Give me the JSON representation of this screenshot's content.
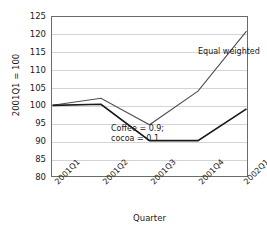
{
  "chart_data": {
    "type": "line",
    "title": "",
    "xlabel": "Quarter",
    "ylabel": "2001Q1 = 100",
    "categories": [
      "2001Q1",
      "2001Q2",
      "2001Q3",
      "2001Q4",
      "2002Q1"
    ],
    "ylim": [
      80,
      125
    ],
    "yticks": [
      80,
      85,
      90,
      95,
      100,
      105,
      110,
      115,
      120,
      125
    ],
    "grid": "horizontal",
    "legend": "none (inline annotations)",
    "series": [
      {
        "name": "Equal weighted",
        "values": [
          100,
          102,
          94.5,
          104,
          121
        ],
        "color": "#4d4d4d",
        "width": 1
      },
      {
        "name": "Coffee = 0.9; cocoa = 0.1",
        "values": [
          100,
          100.3,
          90,
          90,
          99
        ],
        "color": "#1a1a1a",
        "width": 1.6
      }
    ],
    "annotations": [
      {
        "text": "Equal weighted",
        "series": "Equal weighted"
      },
      {
        "text_line1": "Coffee = 0.9;",
        "text_line2": "cocoa = 0.1",
        "series": "Coffee = 0.9; cocoa = 0.1"
      }
    ]
  },
  "axis": {
    "y_tick_labels": [
      "125",
      "120",
      "115",
      "110",
      "105",
      "100",
      "95",
      "90",
      "85",
      "80"
    ],
    "y_axis_title": "2001Q1 = 100",
    "x_tick_labels": [
      "2001Q1",
      "2001Q2",
      "2001Q3",
      "2001Q4",
      "2002Q1"
    ],
    "x_axis_title": "Quarter"
  },
  "annotations": {
    "equal_weighted": "Equal weighted",
    "mix_line1": "Coffee = 0.9;",
    "mix_line2": "cocoa = 0.1"
  },
  "colors": {
    "background": "#ffffff",
    "frame": "#6b6b6b",
    "grid": "#d4d4d4",
    "series_equal_weighted": "#4d4d4d",
    "series_mix": "#1a1a1a",
    "text": "#1a1a1a"
  }
}
